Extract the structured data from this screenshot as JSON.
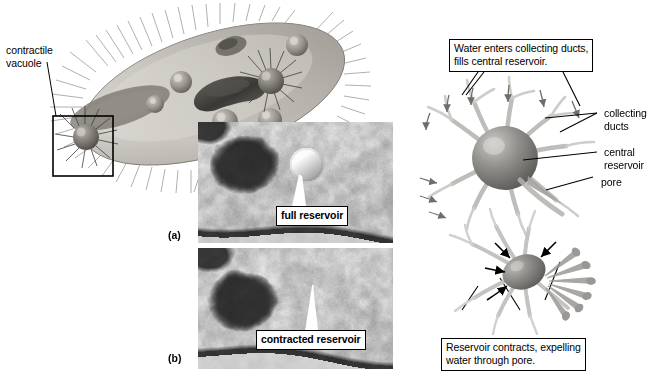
{
  "figure": {
    "background": "#ffffff"
  },
  "left_illustration": {
    "label_contractile_vacuole": "contractile\nvacuole",
    "label_line1": "contractile",
    "label_line2": "vacuole",
    "description": "Grayscale drawing of a Paramecium cell with cilia, oral groove, macronucleus and several contractile vacuoles; a square inset box highlights one contractile vacuole.",
    "colors": {
      "cell_light": "#d8d5cf",
      "cell_mid": "#a8a49c",
      "cell_dark": "#6e6a63",
      "nucleus": "#4b4843",
      "outline": "#000000"
    }
  },
  "micrographs": {
    "panel_a": {
      "panel_label": "(a)",
      "callout": "full reservoir"
    },
    "panel_b": {
      "panel_label": "(b)",
      "callout": "contracted reservoir"
    }
  },
  "right_diagram": {
    "caption_top_line1": "Water enters collecting ducts,",
    "caption_top_line2": "fills central reservoir.",
    "caption_bottom_line1": "Reservoir contracts, expelling",
    "caption_bottom_line2": "water through pore.",
    "labels": [
      {
        "name": "collecting-ducts",
        "line1": "collecting",
        "line2": "ducts"
      },
      {
        "name": "central-reservoir",
        "line1": "central",
        "line2": "reservoir"
      },
      {
        "name": "pore",
        "line1": "pore",
        "line2": ""
      }
    ],
    "colors": {
      "duct": "#b7b5b0",
      "reservoir_light": "#b9b7b2",
      "reservoir_dark": "#6d6b67",
      "arrow": "#000000",
      "droplet": "#8e8c88"
    }
  }
}
